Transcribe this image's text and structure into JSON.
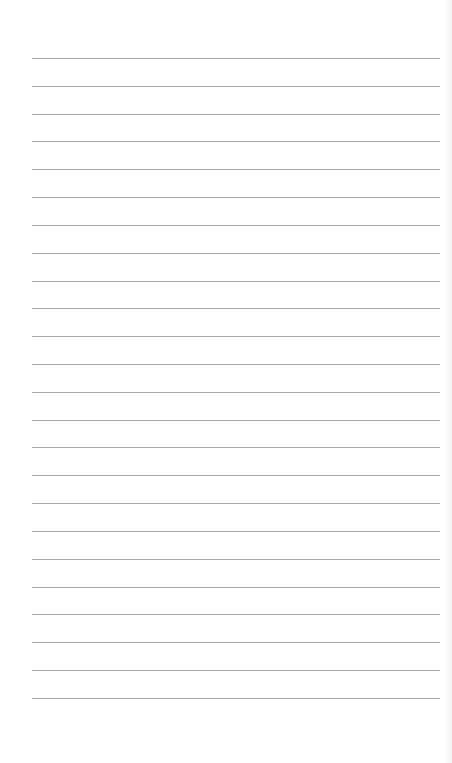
{
  "page": {
    "type": "lined-paper",
    "background_color": "#ffffff",
    "rule_color": "#a8a8a8",
    "rule_left": 32,
    "rule_right": 440,
    "rule_count": 24,
    "rules_y": [
      58,
      86,
      114,
      141,
      169,
      197,
      225,
      253,
      281,
      308,
      336,
      364,
      392,
      420,
      447,
      475,
      503,
      531,
      559,
      587,
      614,
      642,
      670,
      698
    ]
  }
}
